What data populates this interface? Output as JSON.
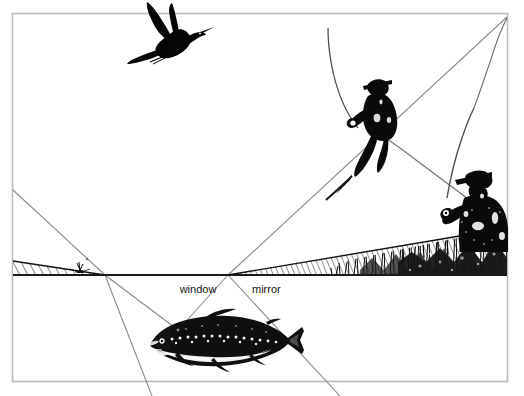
{
  "figure": {
    "frame_color": "#b8b8b8",
    "ink_color": "#000000",
    "background_color": "#ffffff",
    "water_surface_color": "#1a1a1a",
    "sightline_color": "#7a7a7a"
  },
  "labels": {
    "window": "window",
    "mirror": "mirror"
  },
  "scene": {
    "bird": "flying-heron-silhouette",
    "angler_far": "standing-angler-casting",
    "angler_near": "standing-angler-holding-rod",
    "fish": "trout-facing-left",
    "fly_left": "floating-mayfly",
    "bank": "hatched-grass-bank"
  },
  "geometry": {
    "frame": {
      "x": 12,
      "y": 13,
      "width": 496,
      "height": 369
    },
    "water_surface_y": 275,
    "fish_eye": {
      "x": 178,
      "y": 330
    },
    "window_left_edge_x": 105,
    "window_right_edge_x": 228,
    "mirror_label_x": 252,
    "window_label_x": 198
  }
}
